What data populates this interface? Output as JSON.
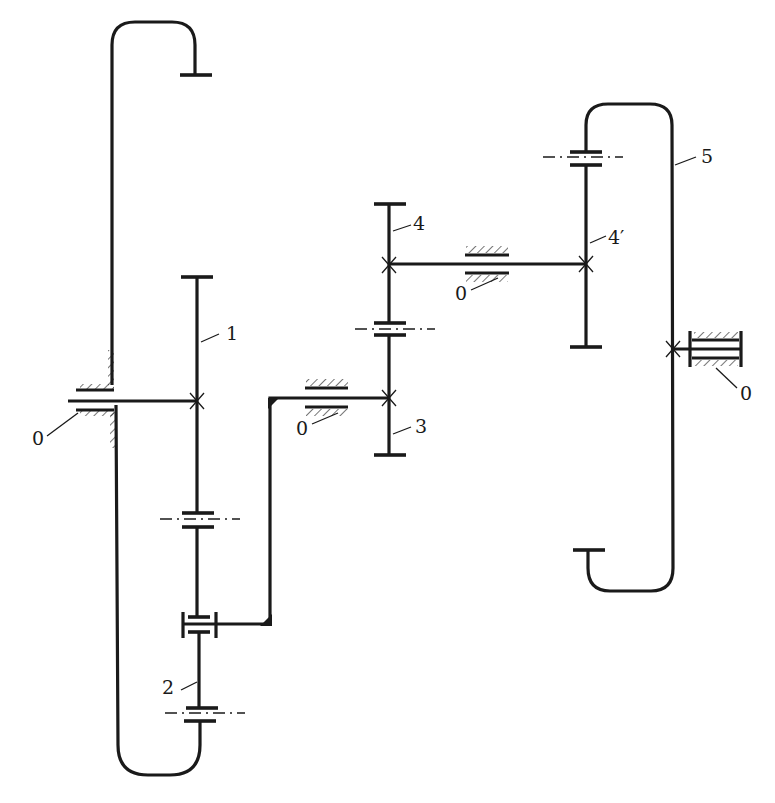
{
  "diagram": {
    "type": "planetary gear train kinematic schematic",
    "labels": {
      "gear_1": "1",
      "gear_2": "2",
      "gear_3": "3",
      "gear_4": "4",
      "gear_4_prime": "4′",
      "gear_5": "5",
      "frame_left": "0",
      "frame_mid": "0",
      "frame_upper": "0",
      "frame_right": "0"
    },
    "components": [
      {
        "id": "1",
        "kind": "sun gear on input shaft"
      },
      {
        "id": "2",
        "kind": "planet gears carried by arm"
      },
      {
        "id": "3",
        "kind": "gear fixed to carrier shaft"
      },
      {
        "id": "4",
        "kind": "gear on countershaft"
      },
      {
        "id": "4′",
        "kind": "gear on countershaft"
      },
      {
        "id": "5",
        "kind": "internal ring gear"
      },
      {
        "id": "0",
        "kind": "fixed frame / bearing"
      }
    ],
    "colors": {
      "line": "#1a1a1a",
      "background": "#ffffff"
    }
  }
}
